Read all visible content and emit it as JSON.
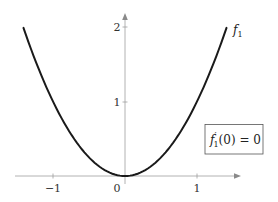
{
  "chart_data": {
    "type": "line",
    "title": "",
    "xlabel": "",
    "ylabel": "",
    "xlim": [
      -1.5,
      1.5
    ],
    "ylim": [
      0,
      2.2
    ],
    "grid": false,
    "x_ticks": [
      -1,
      0,
      1
    ],
    "x_tick_labels": [
      "−1",
      "0",
      "1"
    ],
    "y_ticks": [
      1,
      2
    ],
    "y_tick_labels": [
      "1",
      "2"
    ],
    "series": [
      {
        "name": "f1",
        "label": "f",
        "label_subscript": "1",
        "function": "x^2",
        "x": [
          -1.41,
          -1.2,
          -1.0,
          -0.8,
          -0.6,
          -0.4,
          -0.2,
          0,
          0.2,
          0.4,
          0.6,
          0.8,
          1.0,
          1.2,
          1.41
        ],
        "values": [
          1.99,
          1.44,
          1.0,
          0.64,
          0.36,
          0.16,
          0.04,
          0,
          0.04,
          0.16,
          0.36,
          0.64,
          1.0,
          1.44,
          1.99
        ],
        "color": "#1a1a1a"
      }
    ],
    "annotations": [
      {
        "text": "f′₁(0) = 0",
        "boxed": true,
        "position": "right-middle"
      }
    ]
  },
  "labels": {
    "x_tick_neg1": "−1",
    "x_tick_0": "0",
    "x_tick_1": "1",
    "y_tick_1": "1",
    "y_tick_2": "2",
    "func_f": "f",
    "func_sub": "1",
    "box_f": "f",
    "box_prime": "′",
    "box_sub": "1",
    "box_rest": "(0) = 0"
  },
  "colors": {
    "curve": "#1a1a1a",
    "axis": "#9a9a9a",
    "text": "#333333",
    "box_border": "#555555"
  }
}
